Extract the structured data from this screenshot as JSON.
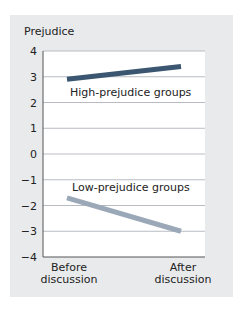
{
  "chart_data": {
    "type": "line",
    "title": "",
    "ylabel": "Prejudice",
    "xlabel": "",
    "categories": [
      "Before discussion",
      "After discussion"
    ],
    "category_lines": [
      [
        "Before",
        "discussion"
      ],
      [
        "After",
        "discussion"
      ]
    ],
    "yticks": [
      4,
      3,
      2,
      1,
      0,
      -1,
      -2,
      -3,
      -4
    ],
    "ytick_labels": [
      "4",
      "3",
      "2",
      "1",
      "0",
      "−1",
      "−2",
      "−3",
      "−4"
    ],
    "ylim": [
      -4,
      4
    ],
    "grid": true,
    "legend": "inline labels",
    "series": [
      {
        "name": "High-prejudice groups",
        "values": [
          2.9,
          3.4
        ],
        "color": "#3a5670"
      },
      {
        "name": "Low-prejudice groups",
        "values": [
          -1.7,
          -3.0
        ],
        "color": "#9aa8b8"
      }
    ]
  },
  "colors": {
    "panel_background": "#e9eaec",
    "plot_background": "#ffffff",
    "gridline": "#b8bcc2",
    "axis": "#555555"
  }
}
